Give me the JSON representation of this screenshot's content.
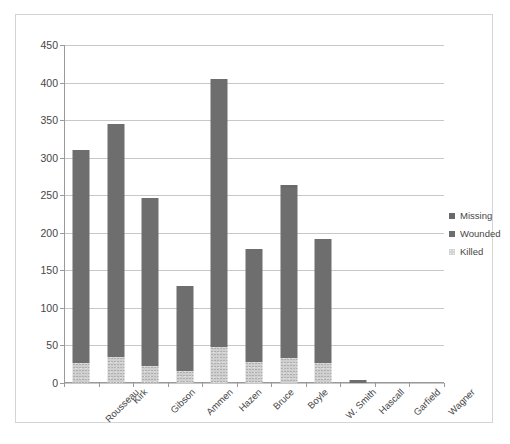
{
  "chart_data": {
    "type": "bar",
    "subtype": "stacked-column",
    "title": "",
    "subtitle": "",
    "xlabel": "",
    "ylabel": "",
    "ylim": [
      0,
      450
    ],
    "ytick_step": 50,
    "ytick_labels": [
      "0",
      "50",
      "100",
      "150",
      "200",
      "250",
      "300",
      "350",
      "400",
      "450"
    ],
    "ytick_values": [
      0,
      50,
      100,
      150,
      200,
      250,
      300,
      350,
      400,
      450
    ],
    "grid": true,
    "grid_axis": "y",
    "legend_position": "right",
    "categories": [
      "Rousseau",
      "Kirk",
      "Gibson",
      "Ammen",
      "Hazen",
      "Bruce",
      "Boyle",
      "W. Smith",
      "Hascall",
      "Garfield",
      "Wagner"
    ],
    "series": [
      {
        "name": "Killed",
        "color": "#d0d0d0",
        "pattern": "speckled",
        "values": [
          27,
          35,
          23,
          16,
          48,
          28,
          33,
          26,
          0,
          0,
          0
        ]
      },
      {
        "name": "Wounded",
        "color": "#6e6e6e",
        "values": [
          283,
          310,
          224,
          113,
          357,
          150,
          227,
          166,
          4,
          0,
          0
        ]
      },
      {
        "name": "Missing",
        "color": "#6a6a6a",
        "values": [
          0,
          0,
          0,
          0,
          0,
          0,
          4,
          0,
          0,
          0,
          0
        ]
      }
    ],
    "totals": [
      310,
      345,
      247,
      129,
      405,
      178,
      264,
      192,
      4,
      0,
      0
    ]
  },
  "legend": {
    "items": [
      {
        "label": "Missing",
        "swatch": "missing"
      },
      {
        "label": "Wounded",
        "swatch": "wounded"
      },
      {
        "label": "Killed",
        "swatch": "killed"
      }
    ]
  },
  "colors": {
    "bar_dark": "#6a6a6a",
    "bar_killed": "#d0d0d0",
    "gridline": "#c8c8c8",
    "axis": "#9a9a9a",
    "frame": "#d4d4d4",
    "text": "#464646",
    "background": "#ffffff"
  }
}
